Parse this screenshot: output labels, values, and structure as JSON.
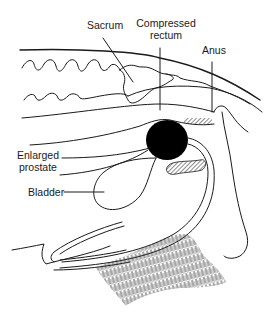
{
  "diagram": {
    "type": "anatomical-cross-section",
    "labels": {
      "sacrum": "Sacrum",
      "compressed_rectum_line1": "Compressed",
      "compressed_rectum_line2": "rectum",
      "anus": "Anus",
      "enlarged_prostate_line1": "Enlarged",
      "enlarged_prostate_line2": "prostate",
      "bladder": "Bladder"
    },
    "colors": {
      "ink": "#1a1a1a",
      "background": "#ffffff",
      "prostate_fill": "#000000"
    }
  }
}
